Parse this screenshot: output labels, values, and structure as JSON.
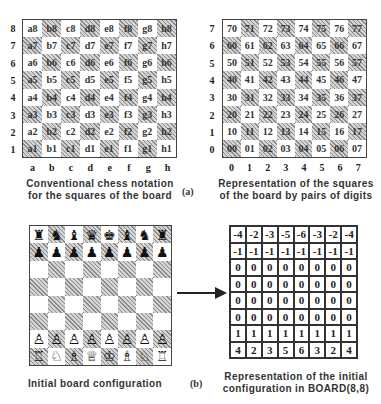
{
  "panel_a": {
    "label": "(a)",
    "notation_board": {
      "rank_labels": [
        "8",
        "7",
        "6",
        "5",
        "4",
        "3",
        "2",
        "1"
      ],
      "file_labels": [
        "a",
        "b",
        "c",
        "d",
        "e",
        "f",
        "g",
        "h"
      ],
      "squares": [
        [
          "a8",
          "b8",
          "c8",
          "d8",
          "e8",
          "f8",
          "g8",
          "h8"
        ],
        [
          "a7",
          "b7",
          "c7",
          "d7",
          "e7",
          "f7",
          "g7",
          "h7"
        ],
        [
          "a6",
          "b6",
          "c6",
          "d6",
          "e6",
          "f6",
          "g6",
          "h6"
        ],
        [
          "a5",
          "b5",
          "c5",
          "d5",
          "e5",
          "f5",
          "g5",
          "h5"
        ],
        [
          "a4",
          "b4",
          "c4",
          "d4",
          "e4",
          "f4",
          "g4",
          "h4"
        ],
        [
          "a3",
          "b3",
          "c3",
          "d3",
          "e3",
          "f3",
          "g3",
          "h3"
        ],
        [
          "a2",
          "b2",
          "c2",
          "d2",
          "e2",
          "f2",
          "g2",
          "h2"
        ],
        [
          "a1",
          "b1",
          "c1",
          "d1",
          "e1",
          "f1",
          "g1",
          "h1"
        ]
      ],
      "caption_line1": "Conventional  chess  notation",
      "caption_line2": "for the squares of the board"
    },
    "digit_board": {
      "rank_labels": [
        "7",
        "6",
        "5",
        "4",
        "3",
        "2",
        "1",
        "0"
      ],
      "file_labels": [
        "0",
        "1",
        "2",
        "3",
        "4",
        "5",
        "6",
        "7"
      ],
      "squares": [
        [
          "70",
          "71",
          "72",
          "73",
          "74",
          "75",
          "76",
          "77"
        ],
        [
          "60",
          "61",
          "62",
          "63",
          "64",
          "65",
          "66",
          "67"
        ],
        [
          "50",
          "51",
          "52",
          "53",
          "54",
          "55",
          "56",
          "57"
        ],
        [
          "40",
          "41",
          "42",
          "43",
          "44",
          "45",
          "46",
          "47"
        ],
        [
          "30",
          "31",
          "32",
          "33",
          "34",
          "35",
          "36",
          "37"
        ],
        [
          "20",
          "21",
          "22",
          "23",
          "24",
          "25",
          "26",
          "27"
        ],
        [
          "10",
          "11",
          "12",
          "13",
          "14",
          "15",
          "16",
          "17"
        ],
        [
          "00",
          "01",
          "02",
          "03",
          "04",
          "05",
          "06",
          "07"
        ]
      ],
      "caption_line1": "Representation  of  the  squares",
      "caption_line2": "of the board by pairs of digits"
    }
  },
  "panel_b": {
    "label": "(b)",
    "initial_board": {
      "pieces": [
        [
          "♜",
          "♞",
          "♝",
          "♛",
          "♚",
          "♝",
          "♞",
          "♜"
        ],
        [
          "♟",
          "♟",
          "♟",
          "♟",
          "♟",
          "♟",
          "♟",
          "♟"
        ],
        [
          "",
          "",
          "",
          "",
          "",
          "",
          "",
          ""
        ],
        [
          "",
          "",
          "",
          "",
          "",
          "",
          "",
          ""
        ],
        [
          "",
          "",
          "",
          "",
          "",
          "",
          "",
          ""
        ],
        [
          "",
          "",
          "",
          "",
          "",
          "",
          "",
          ""
        ],
        [
          "♙",
          "♙",
          "♙",
          "♙",
          "♙",
          "♙",
          "♙",
          "♙"
        ],
        [
          "♖",
          "♘",
          "♗",
          "♕",
          "♔",
          "♗",
          "♘",
          "♖"
        ]
      ],
      "caption": "Initial  board  configuration"
    },
    "arrow": "right-arrow",
    "board_matrix": {
      "values": [
        [
          "-4",
          "-2",
          "-3",
          "-5",
          "-6",
          "-3",
          "-2",
          "-4"
        ],
        [
          "-1",
          "-1",
          "-1",
          "-1",
          "-1",
          "-1",
          "-1",
          "-1"
        ],
        [
          "0",
          "0",
          "0",
          "0",
          "0",
          "0",
          "0",
          "0"
        ],
        [
          "0",
          "0",
          "0",
          "0",
          "0",
          "0",
          "0",
          "0"
        ],
        [
          "0",
          "0",
          "0",
          "0",
          "0",
          "0",
          "0",
          "0"
        ],
        [
          "0",
          "0",
          "0",
          "0",
          "0",
          "0",
          "0",
          "0"
        ],
        [
          "1",
          "1",
          "1",
          "1",
          "1",
          "1",
          "1",
          "1"
        ],
        [
          "4",
          "2",
          "3",
          "5",
          "6",
          "3",
          "2",
          "4"
        ]
      ],
      "caption_line1": "Representation  of  the  initial",
      "caption_line2": "configuration  in  BOARD(8,8)"
    }
  }
}
